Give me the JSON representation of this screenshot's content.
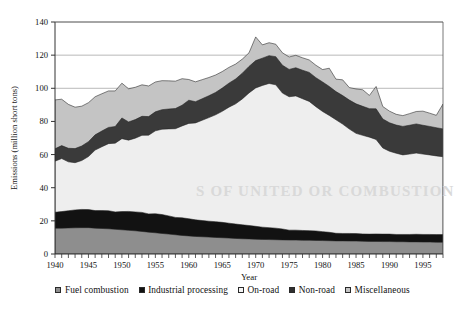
{
  "chart_data": {
    "type": "area",
    "stacked": true,
    "title": "",
    "subtitle": "",
    "xlabel": "Year",
    "ylabel": "Emissions (million short tons)",
    "xlim": [
      1940,
      1998
    ],
    "ylim": [
      0,
      140
    ],
    "yticks": [
      0,
      20,
      40,
      60,
      80,
      100,
      120,
      140
    ],
    "ytick_labels": [
      "0",
      "20",
      "40",
      "60",
      "80",
      "100",
      "120",
      "140"
    ],
    "xticks": [
      1940,
      1945,
      1950,
      1955,
      1960,
      1965,
      1970,
      1975,
      1980,
      1985,
      1990,
      1995
    ],
    "xtick_labels": [
      "1940",
      "1945",
      "1950",
      "1955",
      "1960",
      "1965",
      "1970",
      "1975",
      "1980",
      "1985",
      "1990",
      "1995"
    ],
    "x_minor_tick_interval": 1,
    "grid": "horizontal",
    "legend_position": "bottom",
    "x": [
      1940,
      1941,
      1942,
      1943,
      1944,
      1945,
      1946,
      1947,
      1948,
      1949,
      1950,
      1951,
      1952,
      1953,
      1954,
      1955,
      1956,
      1957,
      1958,
      1959,
      1960,
      1961,
      1962,
      1963,
      1964,
      1965,
      1966,
      1967,
      1968,
      1969,
      1970,
      1971,
      1972,
      1973,
      1974,
      1975,
      1976,
      1977,
      1978,
      1979,
      1980,
      1981,
      1982,
      1983,
      1984,
      1985,
      1986,
      1987,
      1988,
      1989,
      1990,
      1991,
      1992,
      1993,
      1994,
      1995,
      1996,
      1997,
      1998
    ],
    "series": [
      {
        "name": "Fuel combustion",
        "color": "#8e8e8e",
        "values": [
          15.6,
          15.6,
          15.7,
          15.8,
          15.9,
          15.9,
          15.6,
          15.4,
          15.2,
          14.9,
          14.6,
          14.3,
          14.0,
          13.6,
          13.2,
          12.8,
          12.4,
          12.0,
          11.6,
          11.2,
          10.9,
          10.6,
          10.4,
          10.2,
          10.0,
          9.8,
          9.6,
          9.4,
          9.2,
          9.1,
          8.9,
          8.8,
          8.7,
          8.6,
          8.5,
          8.4,
          8.4,
          8.3,
          8.3,
          8.2,
          8.1,
          8.0,
          7.9,
          7.9,
          7.8,
          7.8,
          7.7,
          7.6,
          7.6,
          7.5,
          7.5,
          7.4,
          7.4,
          7.3,
          7.3,
          7.2,
          7.2,
          7.1,
          7.1
        ]
      },
      {
        "name": "Industrial processing",
        "color": "#121212",
        "values": [
          9.6,
          10.0,
          10.4,
          10.8,
          11.0,
          10.9,
          10.6,
          10.8,
          10.9,
          10.5,
          11.0,
          11.4,
          11.4,
          11.5,
          11.0,
          11.5,
          11.4,
          11.0,
          10.5,
          10.6,
          10.4,
          10.0,
          9.8,
          9.6,
          9.5,
          9.3,
          9.0,
          8.7,
          8.4,
          8.1,
          7.8,
          7.4,
          7.2,
          7.0,
          6.6,
          6.0,
          6.0,
          5.9,
          5.8,
          5.7,
          5.4,
          5.1,
          4.6,
          4.5,
          4.6,
          4.5,
          4.4,
          4.4,
          4.5,
          4.5,
          4.5,
          4.4,
          4.4,
          4.5,
          4.6,
          4.6,
          4.6,
          4.6,
          4.6
        ]
      },
      {
        "name": "On-road",
        "color": "#eeeeee",
        "values": [
          30.8,
          32.0,
          29.5,
          28.5,
          29.5,
          32.0,
          36.5,
          38.5,
          40.5,
          41.5,
          44.0,
          43.0,
          44.5,
          46.5,
          47.5,
          50.0,
          51.5,
          52.5,
          53.5,
          55.5,
          57.5,
          58.5,
          60.5,
          62.5,
          64.5,
          67.0,
          70.0,
          72.5,
          76.0,
          80.0,
          83.5,
          85.5,
          87.0,
          86.5,
          82.0,
          80.5,
          81.0,
          79.5,
          78.0,
          75.0,
          72.5,
          70.5,
          68.5,
          66.0,
          63.0,
          60.5,
          59.5,
          58.5,
          57.0,
          52.0,
          50.0,
          49.0,
          48.0,
          48.5,
          49.0,
          48.5,
          48.0,
          47.5,
          47.0
        ]
      },
      {
        "name": "Non-road",
        "color": "#3a3a3a",
        "values": [
          7.5,
          7.8,
          8.2,
          8.5,
          8.8,
          9.0,
          9.2,
          9.5,
          9.8,
          10.0,
          12.5,
          11.0,
          11.2,
          11.5,
          11.2,
          11.5,
          11.8,
          12.0,
          12.2,
          12.5,
          14.0,
          12.8,
          13.0,
          13.2,
          13.5,
          14.0,
          14.5,
          15.0,
          15.5,
          16.0,
          16.5,
          16.5,
          16.8,
          17.0,
          16.8,
          16.5,
          17.0,
          17.2,
          17.5,
          17.5,
          17.8,
          17.5,
          17.0,
          17.2,
          17.5,
          17.8,
          17.5,
          17.2,
          18.5,
          17.5,
          17.2,
          17.0,
          17.2,
          17.4,
          17.6,
          17.4,
          17.2,
          17.0,
          16.8
        ]
      },
      {
        "name": "Miscellaneous",
        "color": "#c4c4c4",
        "values": [
          29.5,
          28.0,
          26.5,
          25.0,
          24.0,
          23.5,
          23.0,
          22.5,
          22.0,
          21.5,
          21.0,
          20.0,
          19.5,
          19.0,
          18.5,
          18.0,
          17.5,
          17.0,
          16.5,
          16.0,
          12.5,
          12.0,
          11.5,
          11.0,
          10.5,
          10.0,
          9.5,
          9.0,
          8.5,
          8.2,
          14.3,
          8.0,
          7.8,
          7.5,
          7.5,
          7.5,
          7.5,
          7.5,
          7.5,
          7.5,
          7.5,
          11.0,
          7.5,
          9.5,
          7.5,
          9.0,
          10.0,
          8.0,
          13.5,
          7.5,
          7.0,
          6.5,
          6.5,
          7.0,
          7.5,
          8.5,
          8.0,
          7.5,
          15.0
        ]
      }
    ]
  },
  "legend": {
    "items": [
      {
        "label": "Fuel combustion",
        "color": "#8e8e8e"
      },
      {
        "label": "Industrial processing",
        "color": "#121212"
      },
      {
        "label": "On-road",
        "color": "#f4f4f4"
      },
      {
        "label": "Non-road",
        "color": "#2f2f2f"
      },
      {
        "label": "Miscellaneous",
        "color": "#c4c4c4"
      }
    ]
  },
  "watermark": {
    "text_1": "S OF UNITED OR COMBUSTION"
  }
}
